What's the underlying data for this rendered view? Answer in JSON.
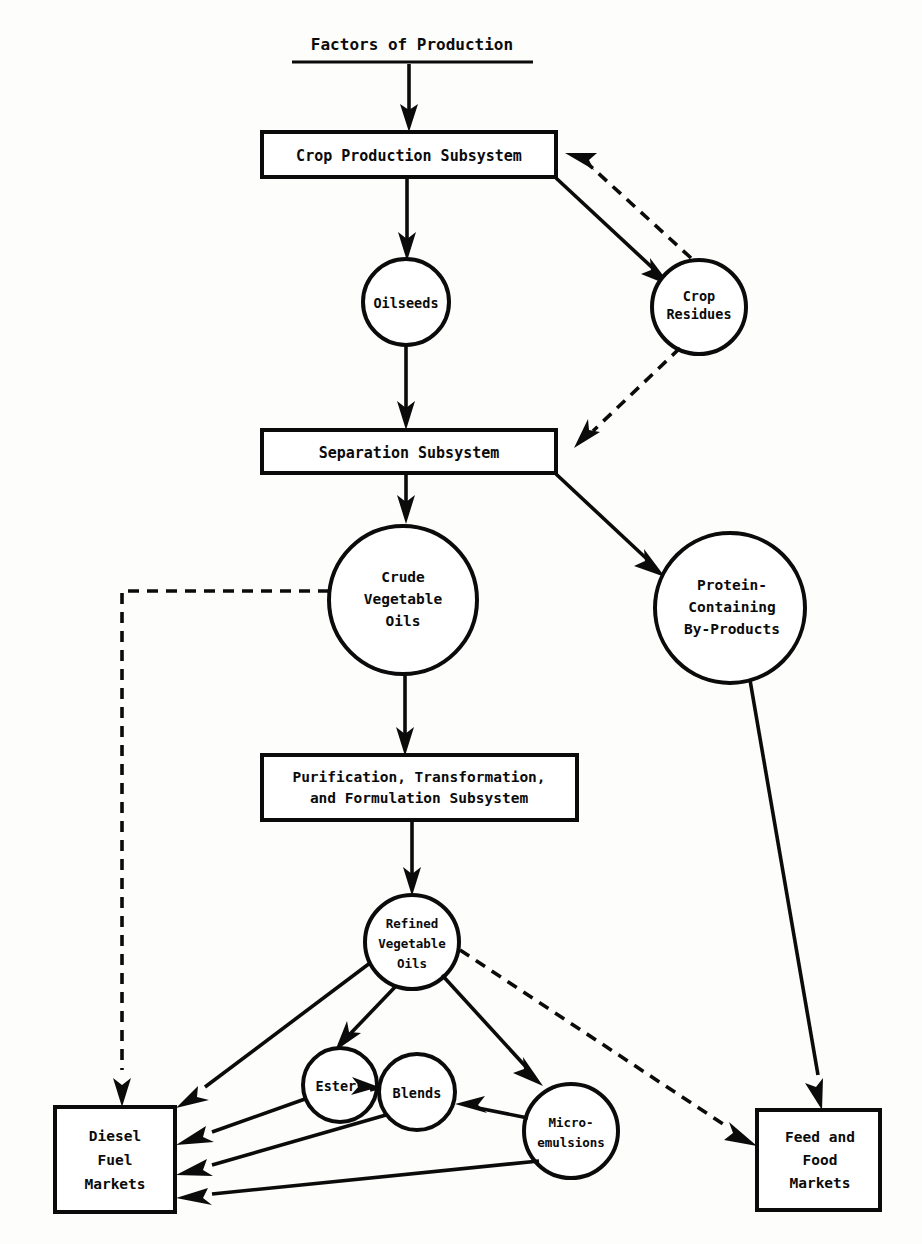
{
  "diagram": {
    "ink_color": "#0b0b0b",
    "background_color": "#fdfdfc",
    "header": {
      "label": "Factors of Production",
      "underlined": true
    },
    "nodes": [
      {
        "id": "crop-production-subsystem",
        "shape": "rect",
        "label": "Crop Production Subsystem",
        "lines": [
          "Crop Production Subsystem"
        ]
      },
      {
        "id": "oilseeds",
        "shape": "circle",
        "label": "Oilseeds",
        "lines": [
          "Oilseeds"
        ]
      },
      {
        "id": "crop-residues",
        "shape": "circle",
        "label": "Crop Residues",
        "lines": [
          "Crop",
          "Residues"
        ]
      },
      {
        "id": "separation-subsystem",
        "shape": "rect",
        "label": "Separation Subsystem",
        "lines": [
          "Separation Subsystem"
        ]
      },
      {
        "id": "crude-vegetable-oils",
        "shape": "circle",
        "label": "Crude Vegetable Oils",
        "lines": [
          "Crude",
          "Vegetable",
          "Oils"
        ]
      },
      {
        "id": "protein-containing-by-products",
        "shape": "circle",
        "label": "Protein-Containing By-Products",
        "lines": [
          "Protein-",
          "Containing",
          "By-Products"
        ]
      },
      {
        "id": "purification-transformation-formulation-subsystem",
        "shape": "rect",
        "label": "Purification, Transformation, and Formulation Subsystem",
        "lines": [
          "Purification, Transformation,",
          "and Formulation Subsystem"
        ]
      },
      {
        "id": "refined-vegetable-oils",
        "shape": "circle",
        "label": "Refined Vegetable Oils",
        "lines": [
          "Refined",
          "Vegetable",
          "Oils"
        ]
      },
      {
        "id": "esters",
        "shape": "circle",
        "label": "Esters",
        "lines": [
          "Esters"
        ]
      },
      {
        "id": "blends",
        "shape": "circle",
        "label": "Blends",
        "lines": [
          "Blends"
        ]
      },
      {
        "id": "micro-emulsions",
        "shape": "circle",
        "label": "Micro-emulsions",
        "lines": [
          "Micro-",
          "emulsions"
        ]
      },
      {
        "id": "diesel-fuel-markets",
        "shape": "rect",
        "label": "Diesel Fuel Markets",
        "lines": [
          "Diesel",
          "Fuel",
          "Markets"
        ]
      },
      {
        "id": "feed-and-food-markets",
        "shape": "rect",
        "label": "Feed and Food Markets",
        "lines": [
          "Feed and",
          "Food",
          "Markets"
        ]
      }
    ],
    "edges": [
      {
        "from": "Factors of Production",
        "to": "Crop Production Subsystem",
        "style": "solid"
      },
      {
        "from": "Crop Production Subsystem",
        "to": "Oilseeds",
        "style": "solid"
      },
      {
        "from": "Crop Production Subsystem",
        "to": "Crop Residues",
        "style": "solid"
      },
      {
        "from": "Crop Residues",
        "to": "Crop Production Subsystem",
        "style": "dashed"
      },
      {
        "from": "Oilseeds",
        "to": "Separation Subsystem",
        "style": "solid"
      },
      {
        "from": "Crop Residues",
        "to": "Separation Subsystem",
        "style": "dashed"
      },
      {
        "from": "Separation Subsystem",
        "to": "Crude Vegetable Oils",
        "style": "solid"
      },
      {
        "from": "Separation Subsystem",
        "to": "Protein-Containing By-Products",
        "style": "solid"
      },
      {
        "from": "Crude Vegetable Oils",
        "to": "Purification, Transformation, and Formulation Subsystem",
        "style": "solid"
      },
      {
        "from": "Crude Vegetable Oils",
        "to": "Diesel Fuel Markets",
        "style": "dashed"
      },
      {
        "from": "Protein-Containing By-Products",
        "to": "Feed and Food Markets",
        "style": "solid"
      },
      {
        "from": "Purification, Transformation, and Formulation Subsystem",
        "to": "Refined Vegetable Oils",
        "style": "solid"
      },
      {
        "from": "Refined Vegetable Oils",
        "to": "Diesel Fuel Markets",
        "style": "solid"
      },
      {
        "from": "Refined Vegetable Oils",
        "to": "Esters",
        "style": "solid"
      },
      {
        "from": "Refined Vegetable Oils",
        "to": "Micro-emulsions",
        "style": "solid"
      },
      {
        "from": "Refined Vegetable Oils",
        "to": "Feed and Food Markets",
        "style": "dashed"
      },
      {
        "from": "Esters",
        "to": "Blends",
        "style": "solid"
      },
      {
        "from": "Esters",
        "to": "Diesel Fuel Markets",
        "style": "solid"
      },
      {
        "from": "Micro-emulsions",
        "to": "Blends",
        "style": "solid"
      },
      {
        "from": "Blends",
        "to": "Diesel Fuel Markets",
        "style": "solid"
      },
      {
        "from": "Micro-emulsions",
        "to": "Diesel Fuel Markets",
        "style": "solid"
      }
    ]
  }
}
